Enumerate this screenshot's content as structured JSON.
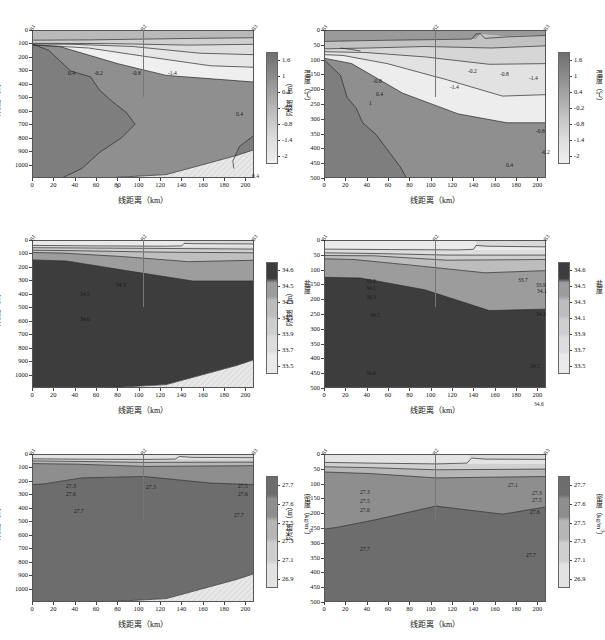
{
  "figure": {
    "columns": 2,
    "rows": 3,
    "station_labels": [
      "B1",
      "B2",
      "B3"
    ],
    "station_positions_km": [
      0,
      104,
      208
    ],
    "axis_x_label": "线距离（km）",
    "axis_y_label": "深度（m）"
  },
  "panels": [
    {
      "id": "temp-deep",
      "variable": "temperature",
      "colorbar_label": "温度（℃）",
      "colorbar_ticks": [
        "1.6",
        "1",
        "0.4",
        "-0.2",
        "-0.8",
        "-1.4",
        "-2"
      ],
      "depth_ticks": [
        "0",
        "100",
        "200",
        "300",
        "400",
        "500",
        "600",
        "700",
        "800",
        "900",
        "1000"
      ],
      "depth_max": 1100,
      "x_ticks": [
        "0",
        "20",
        "40",
        "60",
        "80",
        "100",
        "120",
        "140",
        "160",
        "180",
        "200"
      ],
      "x_max": 208,
      "contour_labels": [
        {
          "text": "0.4",
          "x": 42,
          "y": 44
        },
        {
          "text": "-0.2",
          "x": 68,
          "y": 44
        },
        {
          "text": "-0.8",
          "x": 106,
          "y": 44
        },
        {
          "text": "-1.4",
          "x": 142,
          "y": 44
        },
        {
          "text": "0.4",
          "x": 210,
          "y": 85
        },
        {
          "text": "1",
          "x": 90,
          "y": 157
        },
        {
          "text": "0.4",
          "x": 226,
          "y": 147
        }
      ]
    },
    {
      "id": "temp-shallow",
      "variable": "temperature",
      "colorbar_label": "温度（℃）",
      "colorbar_ticks": [
        "1.6",
        "1",
        "0.4",
        "-0.2",
        "-0.8",
        "-1.4",
        "-2"
      ],
      "depth_ticks": [
        "0",
        "50",
        "100",
        "150",
        "200",
        "250",
        "300",
        "350",
        "400",
        "450",
        "500"
      ],
      "depth_max": 500,
      "x_ticks": [
        "0",
        "20",
        "40",
        "60",
        "80",
        "100",
        "120",
        "140",
        "160",
        "180",
        "200"
      ],
      "x_max": 208,
      "contour_labels": [
        {
          "text": "-0.2",
          "x": 150,
          "y": 42
        },
        {
          "text": "-0.8",
          "x": 182,
          "y": 45
        },
        {
          "text": "-1.4",
          "x": 211,
          "y": 49
        },
        {
          "text": "-0.8",
          "x": 55,
          "y": 52
        },
        {
          "text": "-1.4",
          "x": 132,
          "y": 58
        },
        {
          "text": "0.4",
          "x": 58,
          "y": 65
        },
        {
          "text": "1",
          "x": 51,
          "y": 74
        },
        {
          "text": "-0.8",
          "x": 218,
          "y": 102
        },
        {
          "text": "-0.2",
          "x": 223,
          "y": 123
        },
        {
          "text": "0.4",
          "x": 188,
          "y": 136
        }
      ]
    },
    {
      "id": "salt-deep",
      "variable": "salinity",
      "colorbar_label": "盐度",
      "colorbar_ticks": [
        "34.6",
        "34.5",
        "34.3",
        "34.1",
        "33.9",
        "33.7",
        "33.5"
      ],
      "depth_ticks": [
        "0",
        "100",
        "200",
        "300",
        "400",
        "500",
        "600",
        "700",
        "800",
        "900",
        "1000"
      ],
      "depth_max": 1100,
      "x_ticks": [
        "0",
        "20",
        "40",
        "60",
        "80",
        "100",
        "120",
        "140",
        "160",
        "180",
        "200"
      ],
      "x_max": 208,
      "contour_labels": [
        {
          "text": "34.3",
          "x": 90,
          "y": 46
        },
        {
          "text": "34.5",
          "x": 54,
          "y": 55
        },
        {
          "text": "34.6",
          "x": 54,
          "y": 80
        }
      ]
    },
    {
      "id": "salt-shallow",
      "variable": "salinity",
      "colorbar_label": "盐度",
      "colorbar_ticks": [
        "34.6",
        "34.5",
        "34.3",
        "34.1",
        "33.9",
        "33.7",
        "33.5"
      ],
      "depth_ticks": [
        "0",
        "50",
        "100",
        "150",
        "200",
        "250",
        "300",
        "350",
        "400",
        "450",
        "500"
      ],
      "depth_max": 500,
      "x_ticks": [
        "0",
        "20",
        "40",
        "60",
        "80",
        "100",
        "120",
        "140",
        "160",
        "180",
        "200"
      ],
      "x_max": 208,
      "contour_labels": [
        {
          "text": "33.9",
          "x": 48,
          "y": 42
        },
        {
          "text": "33.7",
          "x": 200,
          "y": 41
        },
        {
          "text": "34.1",
          "x": 48,
          "y": 49
        },
        {
          "text": "33.9",
          "x": 218,
          "y": 46
        },
        {
          "text": "34.1",
          "x": 219,
          "y": 52
        },
        {
          "text": "34.3",
          "x": 48,
          "y": 58
        },
        {
          "text": "34.3",
          "x": 218,
          "y": 75
        },
        {
          "text": "34.5",
          "x": 52,
          "y": 76
        },
        {
          "text": "34.5",
          "x": 212,
          "y": 127
        },
        {
          "text": "34.6",
          "x": 48,
          "y": 134
        },
        {
          "text": "34.6",
          "x": 216,
          "y": 165
        }
      ]
    },
    {
      "id": "dens-deep",
      "variable": "density",
      "colorbar_label": "密度（kg/m3）",
      "colorbar_ticks": [
        "27.7",
        "27.6",
        "27.5",
        "27.3",
        "27.1",
        "26.9"
      ],
      "depth_ticks": [
        "0",
        "100",
        "200",
        "300",
        "400",
        "500",
        "600",
        "700",
        "800",
        "900",
        "1000"
      ],
      "depth_max": 1100,
      "x_ticks": [
        "0",
        "20",
        "40",
        "60",
        "80",
        "100",
        "120",
        "140",
        "160",
        "180",
        "200"
      ],
      "x_max": 208,
      "contour_labels": [
        {
          "text": "27.3",
          "x": 40,
          "y": 33
        },
        {
          "text": "27.3",
          "x": 120,
          "y": 34
        },
        {
          "text": "27.5",
          "x": 212,
          "y": 33
        },
        {
          "text": "27.6",
          "x": 40,
          "y": 41
        },
        {
          "text": "27.6",
          "x": 212,
          "y": 41
        },
        {
          "text": "27.7",
          "x": 48,
          "y": 58
        },
        {
          "text": "27.7",
          "x": 208,
          "y": 62
        }
      ]
    },
    {
      "id": "dens-shallow",
      "variable": "density",
      "colorbar_label": "密度（kg/m3）",
      "colorbar_ticks": [
        "27.7",
        "27.6",
        "27.5",
        "27.3",
        "27.1",
        "26.9"
      ],
      "depth_ticks": [
        "0",
        "50",
        "100",
        "150",
        "200",
        "250",
        "300",
        "350",
        "400",
        "450",
        "500"
      ],
      "depth_max": 500,
      "x_ticks": [
        "0",
        "20",
        "40",
        "60",
        "80",
        "100",
        "120",
        "140",
        "160",
        "180",
        "200"
      ],
      "x_max": 208,
      "contour_labels": [
        {
          "text": "27.1",
          "x": 190,
          "y": 32
        },
        {
          "text": "27.3",
          "x": 42,
          "y": 39
        },
        {
          "text": "27.3",
          "x": 214,
          "y": 40
        },
        {
          "text": "27.5",
          "x": 42,
          "y": 48
        },
        {
          "text": "27.5",
          "x": 214,
          "y": 47
        },
        {
          "text": "27.6",
          "x": 42,
          "y": 57
        },
        {
          "text": "27.6",
          "x": 212,
          "y": 59
        },
        {
          "text": "27.7",
          "x": 42,
          "y": 96
        },
        {
          "text": "27.7",
          "x": 208,
          "y": 102
        }
      ]
    }
  ],
  "chart_data": {
    "type": "heatmap",
    "title": "",
    "xlabel": "线距离（km）",
    "ylabel": "深度（m）",
    "grid": false,
    "legend_position": "right",
    "transect_stations": [
      "B1",
      "B2",
      "B3"
    ],
    "panels": [
      {
        "name": "温度 0-1000m",
        "variable": "温度",
        "units": "℃",
        "xlim": [
          0,
          208
        ],
        "ylim": [
          1100,
          0
        ],
        "clim": [
          -2,
          1.9
        ],
        "colorbar_ticks": [
          1.6,
          1,
          0.4,
          -0.2,
          -0.8,
          -1.4,
          -2
        ],
        "contour_levels": [
          1,
          0.4,
          -0.2,
          -0.8,
          -1.4
        ],
        "description": "Warm core (>1℃) near B1 shoaling to 100 m; cold surface layer -2℃ thickens eastward toward B3; 0.4℃ isotherm deepens to ~380 m at B3"
      },
      {
        "name": "温度 0-500m",
        "variable": "温度",
        "units": "℃",
        "xlim": [
          0,
          208
        ],
        "ylim": [
          500,
          0
        ],
        "clim": [
          -2,
          1.9
        ],
        "colorbar_ticks": [
          1.6,
          1,
          0.4,
          -0.2,
          -0.8,
          -1.4,
          -2
        ],
        "contour_levels": [
          1,
          0.4,
          -0.2,
          -0.8,
          -1.4
        ],
        "description": "Zoom of upper 500 m; isotherms -1.4, -0.8, -0.2, 0.4 slope downward from B1 to B3"
      },
      {
        "name": "盐度 0-1000m",
        "variable": "盐度",
        "units": "",
        "xlim": [
          0,
          208
        ],
        "ylim": [
          1100,
          0
        ],
        "clim": [
          33.4,
          34.7
        ],
        "colorbar_ticks": [
          34.6,
          34.5,
          34.3,
          34.1,
          33.9,
          33.7,
          33.5
        ],
        "contour_levels": [
          34.6,
          34.5,
          34.3,
          34.1,
          33.9,
          33.7
        ],
        "description": "Fresh surface layer <33.7; 34.6 isohaline at ~320 m near B1 deepening to ~450 m at B3"
      },
      {
        "name": "盐度 0-500m",
        "variable": "盐度",
        "units": "",
        "xlim": [
          0,
          208
        ],
        "ylim": [
          500,
          0
        ],
        "clim": [
          33.4,
          34.7
        ],
        "colorbar_ticks": [
          34.6,
          34.5,
          34.3,
          34.1,
          33.9,
          33.7,
          33.5
        ],
        "contour_levels": [
          34.6,
          34.5,
          34.3,
          34.1,
          33.9,
          33.7
        ],
        "description": "Halocline 30-120 m; 34.5 isohaline from 130 m at B1 to 320 m at B3"
      },
      {
        "name": "密度 0-1000m",
        "variable": "密度",
        "units": "kg/m3",
        "xlim": [
          0,
          208
        ],
        "ylim": [
          1100,
          0
        ],
        "clim": [
          26.8,
          27.75
        ],
        "colorbar_ticks": [
          27.7,
          27.6,
          27.5,
          27.3,
          27.1,
          26.9
        ],
        "contour_levels": [
          27.7,
          27.6,
          27.5,
          27.3,
          27.1
        ],
        "description": "27.7 isopycnal domes upward to ~190 m near B2, deepening to 250-280 m at both ends"
      },
      {
        "name": "密度 0-500m",
        "variable": "密度",
        "units": "kg/m3",
        "xlim": [
          0,
          208
        ],
        "ylim": [
          500,
          0
        ],
        "clim": [
          26.8,
          27.75
        ],
        "colorbar_ticks": [
          27.7,
          27.6,
          27.5,
          27.3,
          27.1,
          26.9
        ],
        "contour_levels": [
          27.7,
          27.6,
          27.5,
          27.3,
          27.1
        ],
        "description": "Pycnocline 30-100 m; 27.7 isopycnal peaks at 175 m near 104 km"
      }
    ]
  }
}
